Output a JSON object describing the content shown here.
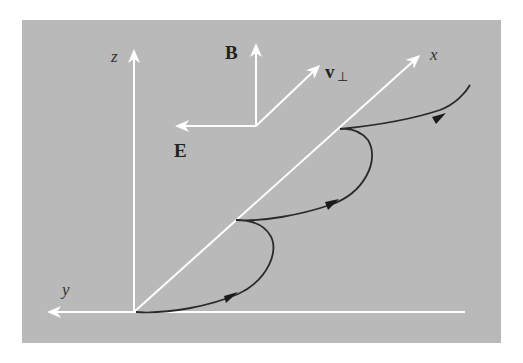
{
  "diagram": {
    "type": "physics-vector-diagram",
    "colors": {
      "background": "#b9b9b9",
      "axes": "#ffffff",
      "trajectory": "#2a2a2a",
      "labels": "#222222"
    },
    "axes": {
      "x_label": "x",
      "y_label": "y",
      "z_label": "z"
    },
    "vectors": {
      "B_label": "B",
      "E_label": "E",
      "v_label": "v",
      "v_subscript": "⊥"
    },
    "trajectory": {
      "arrow_count": 3,
      "cusp_count": 2
    }
  }
}
